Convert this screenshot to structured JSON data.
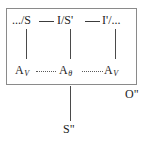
{
  "diagram": {
    "box": {
      "border_color": "#8a8a8a"
    },
    "top_row": {
      "nodes": [
        {
          "id": "top-left",
          "text": ".../S"
        },
        {
          "id": "top-mid",
          "text": "I/S'"
        },
        {
          "id": "top-right",
          "text": "I'/..."
        }
      ],
      "connector_style": "solid-dash",
      "connector_color": "#3c3c3c"
    },
    "bottom_row": {
      "nodes": [
        {
          "id": "bot-left",
          "base": "A",
          "subscript": "V"
        },
        {
          "id": "bot-mid",
          "base": "A",
          "subscript": "θ"
        },
        {
          "id": "bot-right",
          "base": "A",
          "subscript": "V"
        }
      ],
      "connector_style": "dotted",
      "connector_color": "#5a5a5a"
    },
    "vertical_connector_color": "#4a4a4a",
    "outside_labels": {
      "right": "O\"",
      "bottom": "S\""
    }
  }
}
